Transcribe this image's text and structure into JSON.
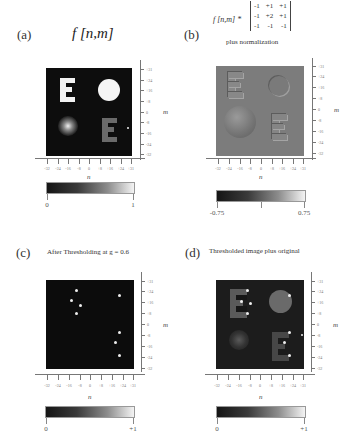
{
  "figure": {
    "panels": [
      {
        "id": "a",
        "label": "(a)",
        "title": "f [n,m]",
        "xlabel": "n",
        "ylabel": "m",
        "x_ticks": [
          "-32",
          "-24",
          "-16",
          "-8",
          "0",
          "+8",
          "+16",
          "+24",
          "+31"
        ],
        "y_ticks": [
          "+31",
          "+24",
          "+16",
          "+8",
          "0",
          "-8",
          "-16",
          "-24",
          "-32"
        ],
        "colorbar": {
          "min_label": "0",
          "mid_label": "",
          "max_label": "1"
        }
      },
      {
        "id": "b",
        "label": "(b)",
        "title_prefix": "f [n,m] *",
        "kernel": [
          [
            "-1",
            "+1",
            "+1"
          ],
          [
            "-1",
            "+2",
            "+1"
          ],
          [
            "-1",
            "-1",
            "-1"
          ]
        ],
        "subtitle": "plus normalization",
        "xlabel": "n",
        "ylabel": "m",
        "x_ticks": [
          "-32",
          "-24",
          "-16",
          "-8",
          "0",
          "+8",
          "+16",
          "+24",
          "+31"
        ],
        "y_ticks": [
          "+31",
          "+24",
          "+16",
          "+8",
          "0",
          "-8",
          "-16",
          "-24",
          "-32"
        ],
        "colorbar": {
          "min_label": "-0.75",
          "mid_label": "0",
          "max_label": "0.75"
        }
      },
      {
        "id": "c",
        "label": "(c)",
        "title": "After Thresholding at g = 0.6",
        "xlabel": "n",
        "ylabel": "m",
        "x_ticks": [
          "-32",
          "-24",
          "-16",
          "-8",
          "0",
          "+8",
          "+16",
          "+24",
          "+31"
        ],
        "y_ticks": [
          "+31",
          "+24",
          "+16",
          "+8",
          "0",
          "-8",
          "-16",
          "-24",
          "-32"
        ],
        "colorbar": {
          "min_label": "0",
          "mid_label": "",
          "max_label": "+1"
        }
      },
      {
        "id": "d",
        "label": "(d)",
        "title": "Thresholded image plus original",
        "xlabel": "n",
        "ylabel": "m",
        "x_ticks": [
          "-32",
          "-24",
          "-16",
          "-8",
          "0",
          "+8",
          "+16",
          "+24",
          "+31"
        ],
        "y_ticks": [
          "+31",
          "+24",
          "+16",
          "+8",
          "0",
          "-8",
          "-16",
          "-24",
          "-32"
        ],
        "colorbar": {
          "min_label": "0",
          "mid_label": "",
          "max_label": "+1"
        }
      }
    ]
  }
}
